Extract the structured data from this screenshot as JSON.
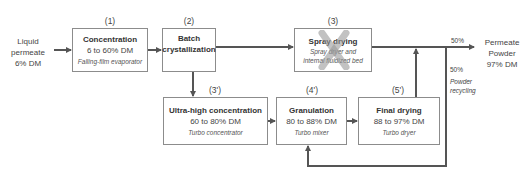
{
  "input": {
    "line1": "Liquid",
    "line2": "permeate",
    "line3": "6% DM"
  },
  "output": {
    "line1": "Permeate",
    "line2": "Powder",
    "line3": "97% DM"
  },
  "steps": [
    {
      "id": "(1)",
      "title": "Concentration",
      "dm": "6 to 60% DM",
      "equipment": "Falling-film evaporator"
    },
    {
      "id": "(2)",
      "title_line1": "Batch",
      "title_line2": "crystallization"
    },
    {
      "id": "(3)",
      "title": "Spray drying",
      "equipment_line1": "Spray dryer and",
      "equipment_line2": "internal fluidized bed",
      "crossed_out": true
    },
    {
      "id": "(3')",
      "title": "Ultra-high concentration",
      "dm": "60 to 80% DM",
      "equipment": "Turbo concentrator"
    },
    {
      "id": "(4')",
      "title": "Granulation",
      "dm": "80 to 88% DM",
      "equipment": "Turbo mixer"
    },
    {
      "id": "(5')",
      "title": "Final drying",
      "dm": "88 to 97% DM",
      "equipment": "Turbo dryer"
    }
  ],
  "split": {
    "output_pct": "50%",
    "recycle_pct": "50%",
    "recycle_label_line1": "Powder",
    "recycle_label_line2": "recycling"
  },
  "colors": {
    "line": "#555555",
    "box_border": "#8c8c8c",
    "cross": "#9a9a9a"
  }
}
